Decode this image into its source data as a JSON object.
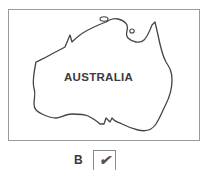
{
  "map": {
    "label": "AUSTRALIA",
    "outline_color": "#444444",
    "frame_color": "#9a9a9a"
  },
  "answer": {
    "letter": "B",
    "checkbox_checked": true,
    "check_glyph": "✔"
  }
}
